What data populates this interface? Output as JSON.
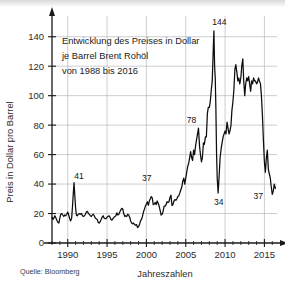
{
  "figure": {
    "title_lines": [
      "Entwicklung des Preises in Dollar",
      "je Barrel Brent Rohöl",
      "von 1988 bis 2016"
    ],
    "source": "Quelle: Bloomberg",
    "y_axis_name": "Preis in Dollar pro Barrel",
    "x_axis_name": "Jahreszahlen"
  },
  "chart_data": {
    "type": "line",
    "title": "Entwicklung des Preises in Dollar je Barrel Brent Rohöl von 1988 bis 2016",
    "xlabel": "Jahreszahlen",
    "ylabel": "Preis in Dollar pro Barrel",
    "xlim": [
      1988,
      2016.6
    ],
    "ylim": [
      0,
      150
    ],
    "xticks": [
      1990,
      1995,
      2000,
      2005,
      2010,
      2015
    ],
    "xtick_labels": [
      "1990",
      "1995",
      "2000",
      "2005",
      "2010",
      "2015"
    ],
    "yticks": [
      0,
      20,
      40,
      60,
      80,
      100,
      120,
      140
    ],
    "ytick_labels": [
      "0",
      "20",
      "40",
      "60",
      "80",
      "100",
      "120",
      "140"
    ],
    "grid": true,
    "grid_axis": "both",
    "legend": "none",
    "series_name": "Brent Rohöl Preis",
    "line_color": "#0d0d0d",
    "annotations": [
      {
        "label": "41",
        "x": 1990.8,
        "y": 41
      },
      {
        "label": "37",
        "x": 2000.3,
        "y": 37
      },
      {
        "label": "78",
        "x": 2006.5,
        "y": 78
      },
      {
        "label": "144",
        "x": 2008.5,
        "y": 144
      },
      {
        "label": "34",
        "x": 2008.95,
        "y": 34
      },
      {
        "label": "37",
        "x": 2016.0,
        "y": 37
      }
    ],
    "x": [
      1988.0,
      1988.12,
      1988.25,
      1988.37,
      1988.5,
      1988.62,
      1988.75,
      1988.87,
      1989.0,
      1989.12,
      1989.25,
      1989.37,
      1989.5,
      1989.62,
      1989.75,
      1989.87,
      1990.0,
      1990.12,
      1990.25,
      1990.37,
      1990.5,
      1990.62,
      1990.7,
      1990.8,
      1990.9,
      1991.0,
      1991.1,
      1991.2,
      1991.35,
      1991.5,
      1991.62,
      1991.75,
      1991.87,
      1992.0,
      1992.12,
      1992.25,
      1992.37,
      1992.5,
      1992.62,
      1992.75,
      1992.87,
      1993.0,
      1993.12,
      1993.25,
      1993.37,
      1993.5,
      1993.62,
      1993.75,
      1993.87,
      1994.0,
      1994.12,
      1994.25,
      1994.37,
      1994.5,
      1994.62,
      1994.75,
      1994.87,
      1995.0,
      1995.12,
      1995.25,
      1995.37,
      1995.5,
      1995.62,
      1995.75,
      1995.87,
      1996.0,
      1996.12,
      1996.25,
      1996.37,
      1996.5,
      1996.62,
      1996.75,
      1996.87,
      1997.0,
      1997.12,
      1997.25,
      1997.37,
      1997.5,
      1997.62,
      1997.75,
      1997.87,
      1998.0,
      1998.12,
      1998.25,
      1998.37,
      1998.5,
      1998.62,
      1998.75,
      1998.87,
      1999.0,
      1999.12,
      1999.25,
      1999.37,
      1999.5,
      1999.62,
      1999.75,
      1999.87,
      2000.0,
      2000.12,
      2000.25,
      2000.37,
      2000.5,
      2000.62,
      2000.75,
      2000.87,
      2001.0,
      2001.12,
      2001.25,
      2001.37,
      2001.5,
      2001.62,
      2001.75,
      2001.87,
      2002.0,
      2002.12,
      2002.25,
      2002.37,
      2002.5,
      2002.62,
      2002.75,
      2002.87,
      2003.0,
      2003.12,
      2003.25,
      2003.37,
      2003.5,
      2003.62,
      2003.75,
      2003.87,
      2004.0,
      2004.12,
      2004.25,
      2004.37,
      2004.5,
      2004.62,
      2004.75,
      2004.87,
      2005.0,
      2005.12,
      2005.25,
      2005.37,
      2005.5,
      2005.62,
      2005.75,
      2005.87,
      2006.0,
      2006.12,
      2006.25,
      2006.37,
      2006.5,
      2006.62,
      2006.75,
      2006.87,
      2007.0,
      2007.12,
      2007.25,
      2007.37,
      2007.5,
      2007.62,
      2007.75,
      2007.87,
      2008.0,
      2008.12,
      2008.25,
      2008.37,
      2008.5,
      2008.58,
      2008.67,
      2008.75,
      2008.83,
      2008.92,
      2009.0,
      2009.12,
      2009.25,
      2009.37,
      2009.5,
      2009.62,
      2009.75,
      2009.87,
      2010.0,
      2010.12,
      2010.25,
      2010.37,
      2010.5,
      2010.62,
      2010.75,
      2010.87,
      2011.0,
      2011.12,
      2011.25,
      2011.37,
      2011.5,
      2011.62,
      2011.75,
      2011.87,
      2012.0,
      2012.12,
      2012.25,
      2012.37,
      2012.5,
      2012.62,
      2012.75,
      2012.87,
      2013.0,
      2013.12,
      2013.25,
      2013.37,
      2013.5,
      2013.62,
      2013.75,
      2013.87,
      2014.0,
      2014.12,
      2014.25,
      2014.37,
      2014.5,
      2014.62,
      2014.75,
      2014.87,
      2015.0,
      2015.12,
      2015.25,
      2015.37,
      2015.5,
      2015.62,
      2015.75,
      2015.87,
      2016.0,
      2016.12,
      2016.25,
      2016.4
    ],
    "y": [
      17.5,
      16.0,
      17.0,
      18.5,
      17.0,
      15.5,
      14.0,
      13.5,
      17.0,
      19.5,
      20.0,
      19.0,
      18.0,
      19.0,
      18.5,
      19.5,
      21.0,
      19.0,
      16.5,
      15.0,
      17.0,
      26.0,
      33.0,
      41.0,
      32.0,
      24.0,
      19.0,
      18.5,
      19.5,
      20.0,
      19.5,
      20.0,
      18.5,
      18.0,
      18.5,
      19.5,
      21.0,
      21.5,
      20.0,
      19.5,
      18.5,
      18.0,
      19.0,
      19.5,
      18.5,
      17.0,
      16.5,
      16.0,
      14.0,
      13.5,
      14.5,
      16.0,
      17.5,
      18.5,
      17.0,
      16.5,
      16.5,
      17.5,
      18.0,
      18.5,
      17.5,
      16.0,
      15.5,
      16.5,
      17.5,
      18.0,
      18.5,
      20.5,
      19.0,
      19.5,
      21.0,
      22.5,
      23.5,
      23.0,
      20.0,
      18.0,
      18.5,
      18.0,
      19.5,
      19.0,
      17.5,
      15.0,
      13.5,
      13.0,
      13.5,
      12.5,
      12.0,
      12.5,
      10.5,
      11.0,
      12.5,
      15.0,
      16.0,
      18.0,
      21.0,
      23.0,
      25.0,
      26.5,
      28.0,
      25.5,
      28.5,
      30.0,
      31.5,
      30.5,
      26.0,
      26.5,
      27.5,
      26.0,
      28.5,
      27.0,
      25.0,
      22.0,
      19.0,
      19.5,
      21.5,
      25.0,
      25.0,
      26.0,
      28.0,
      27.5,
      28.0,
      31.0,
      32.5,
      25.5,
      26.0,
      28.5,
      29.5,
      29.0,
      30.0,
      31.5,
      32.0,
      34.0,
      36.0,
      38.0,
      42.0,
      44.0,
      40.0,
      44.0,
      48.0,
      52.0,
      54.0,
      58.0,
      62.0,
      58.0,
      56.0,
      63.0,
      60.0,
      66.0,
      70.0,
      74.0,
      78.0,
      66.0,
      60.0,
      55.0,
      58.0,
      68.0,
      67.0,
      72.0,
      72.0,
      88.0,
      92.0,
      92.0,
      96.0,
      104.0,
      110.0,
      132.0,
      144.0,
      120.0,
      112.0,
      92.0,
      60.0,
      44.0,
      34.0,
      46.0,
      58.0,
      64.0,
      68.0,
      72.0,
      74.0,
      76.0,
      74.0,
      82.0,
      78.0,
      74.0,
      76.0,
      80.0,
      90.0,
      96.0,
      104.0,
      118.0,
      121.0,
      116.0,
      110.0,
      112.0,
      108.0,
      112.0,
      120.0,
      125.0,
      110.0,
      100.0,
      108.0,
      112.0,
      110.0,
      113.0,
      108.0,
      103.0,
      110.0,
      108.0,
      112.0,
      110.0,
      110.0,
      108.0,
      109.0,
      112.0,
      110.0,
      108.0,
      100.0,
      86.0,
      70.0,
      55.0,
      48.0,
      58.0,
      63.0,
      50.0,
      47.0,
      44.0,
      38.0,
      33.0,
      35.0,
      40.0,
      37.0
    ]
  }
}
